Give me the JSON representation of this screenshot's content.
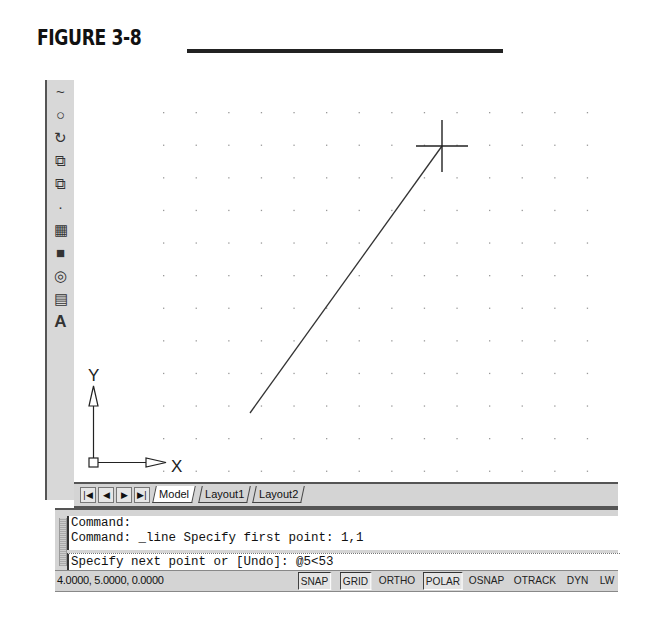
{
  "figure": {
    "title": "FIGURE 3-8"
  },
  "toolbar": {
    "items": [
      {
        "name": "spline-icon",
        "glyph": "~"
      },
      {
        "name": "ellipse-icon",
        "glyph": "○"
      },
      {
        "name": "ellipse-arc-icon",
        "glyph": "↻"
      },
      {
        "name": "insert-block-icon",
        "glyph": "⧉"
      },
      {
        "name": "make-block-icon",
        "glyph": "⧉"
      },
      {
        "name": "point-icon",
        "glyph": "·"
      },
      {
        "name": "hatch-icon",
        "glyph": "▦"
      },
      {
        "name": "gradient-icon",
        "glyph": "■"
      },
      {
        "name": "region-icon",
        "glyph": "◎"
      },
      {
        "name": "table-icon",
        "glyph": "▤"
      },
      {
        "name": "multiline-text-icon",
        "glyph": "A"
      }
    ]
  },
  "canvas": {
    "grid": {
      "x0": 89,
      "y0": 32,
      "spacing": 32.6,
      "cols": 17,
      "rows": 12,
      "dot_color": "#999999"
    },
    "line": {
      "x1": 176,
      "y1": 333,
      "x2": 368,
      "y2": 66
    },
    "crosshair": {
      "x": 368,
      "y": 66,
      "size": 26
    },
    "ucs": {
      "x_label": "X",
      "y_label": "Y"
    }
  },
  "tabs": {
    "nav": [
      "|◀",
      "◀",
      "▶",
      "▶|"
    ],
    "items": [
      {
        "label": "Model",
        "active": true
      },
      {
        "label": "Layout1",
        "active": false
      },
      {
        "label": "Layout2",
        "active": false
      }
    ]
  },
  "command": {
    "history": [
      "Command:",
      "Command: _line Specify first point: 1,1"
    ],
    "current": "Specify next point or [Undo]: @5<53"
  },
  "status": {
    "coordinates": "4.0000, 5.0000, 0.0000",
    "buttons": [
      {
        "label": "SNAP",
        "on": true,
        "x": 243
      },
      {
        "label": "GRID",
        "on": true,
        "x": 285
      },
      {
        "label": "ORTHO",
        "on": false,
        "x": 322
      },
      {
        "label": "POLAR",
        "on": true,
        "x": 368
      },
      {
        "label": "OSNAP",
        "on": false,
        "x": 412
      },
      {
        "label": "OTRACK",
        "on": false,
        "x": 457
      },
      {
        "label": "DYN",
        "on": false,
        "x": 510
      },
      {
        "label": "LW",
        "on": false,
        "x": 543
      }
    ]
  }
}
